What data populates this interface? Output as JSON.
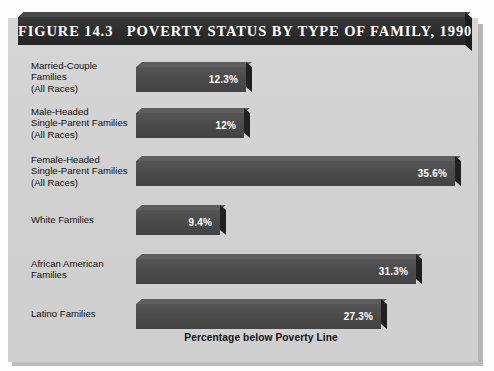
{
  "figure": {
    "title": "FIGURE 14.3   POVERTY STATUS BY TYPE OF FAMILY, 1990",
    "caption": "Percentage below Poverty Line"
  },
  "chart_data": {
    "type": "bar",
    "orientation": "horizontal",
    "title": "FIGURE 14.3   POVERTY STATUS BY TYPE OF FAMILY, 1990",
    "xlabel": "Percentage below Poverty Line",
    "ylabel": "",
    "xlim": [
      0,
      35.6
    ],
    "grid": false,
    "legend": false,
    "categories": [
      "Married-Couple\nFamilies\n(All Races)",
      "Male-Headed\nSingle-Parent Families\n(All Races)",
      "Female-Headed\nSingle-Parent Families\n(All Races)",
      "White Families",
      "African American\nFamilies",
      "Latino Families"
    ],
    "values": [
      12.3,
      12,
      35.6,
      9.4,
      31.3,
      27.3
    ],
    "value_labels": [
      "12.3%",
      "12%",
      "35.6%",
      "9.4%",
      "31.3%",
      "27.3%"
    ],
    "bar_color": "#4a4a4a",
    "background_color": "#d3d3d3"
  },
  "rows": [
    {
      "label": "Married-Couple\nFamilies\n(All Races)",
      "value_label": "12.3%",
      "value": 12.3,
      "top": 62,
      "label_top": 60,
      "width": 110
    },
    {
      "label": "Male-Headed\nSingle-Parent Families\n(All Races)",
      "value_label": "12%",
      "value": 12,
      "top": 108,
      "label_top": 106,
      "width": 108
    },
    {
      "label": "Female-Headed\nSingle-Parent Families\n(All Races)",
      "value_label": "35.6%",
      "value": 35.6,
      "top": 156,
      "label_top": 154,
      "width": 319
    },
    {
      "label": "White Families",
      "value_label": "9.4%",
      "value": 9.4,
      "top": 205,
      "label_top": 214,
      "width": 84
    },
    {
      "label": "African American\nFamilies",
      "value_label": "31.3%",
      "value": 31.3,
      "top": 254,
      "label_top": 258,
      "width": 280
    },
    {
      "label": "Latino Families",
      "value_label": "27.3%",
      "value": 27.3,
      "top": 299,
      "label_top": 308,
      "width": 245
    }
  ]
}
